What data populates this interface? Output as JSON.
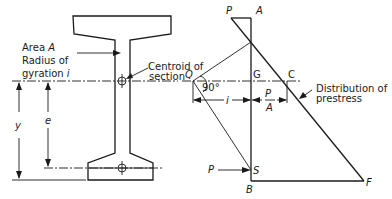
{
  "figure": {
    "section_labels": {
      "area_line1": "Area ",
      "area_symbol": "A",
      "radius_line": "Radius of",
      "gyration_line": "gyration ",
      "gyration_symbol": "i",
      "centroid_line1": "Centroid of",
      "centroid_line2": "section"
    },
    "dimensions": {
      "y": "y",
      "e": "e",
      "i": "i",
      "p_over_a_num": "P",
      "p_over_a_den": "A"
    },
    "points": {
      "P_top": "P",
      "A": "A",
      "Q": "Q",
      "G": "G",
      "C": "C",
      "S": "S",
      "B": "B",
      "F": "F",
      "P_force": "P"
    },
    "angle": "90°",
    "distribution_line1": "Distribution of",
    "distribution_line2": "prestress"
  }
}
